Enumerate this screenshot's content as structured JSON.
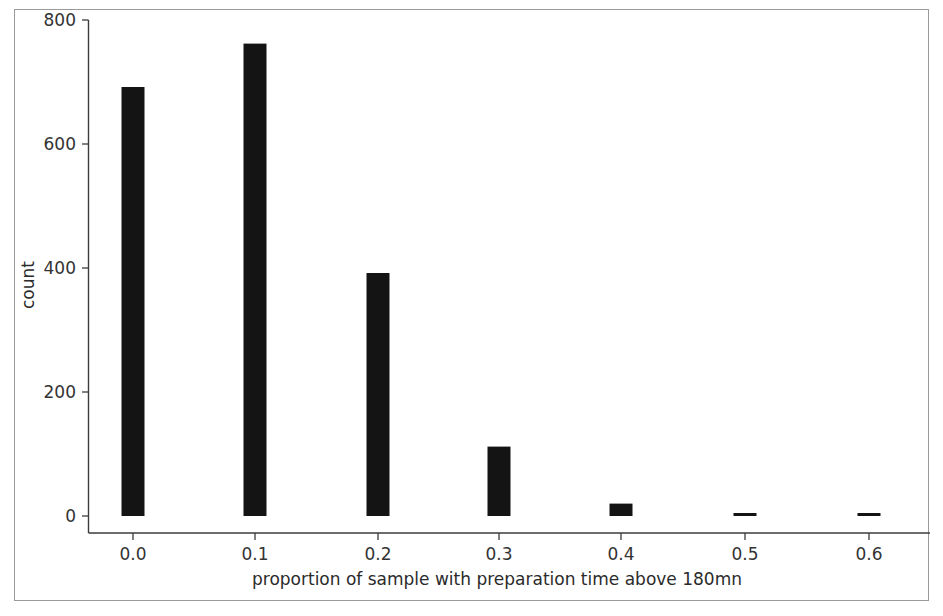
{
  "chart_data": {
    "type": "bar",
    "title": "",
    "subtitle": "",
    "xlabel": "proportion of sample with preparation time above 180mn",
    "ylabel": "count",
    "categories": [
      "0.0",
      "0.1",
      "0.2",
      "0.3",
      "0.4",
      "0.5",
      "0.6"
    ],
    "x": [
      0.0,
      0.1,
      0.2,
      0.3,
      0.4,
      0.5,
      0.6
    ],
    "values": [
      692,
      762,
      392,
      112,
      20,
      3,
      3
    ],
    "xlim": [
      -0.05,
      0.65
    ],
    "ylim": [
      0,
      820
    ],
    "xticks": [
      "0.0",
      "0.1",
      "0.2",
      "0.3",
      "0.4",
      "0.5",
      "0.6"
    ],
    "yticks": [
      "0",
      "200",
      "400",
      "600",
      "800"
    ],
    "ytick_values": [
      0,
      200,
      400,
      600,
      800
    ],
    "grid": false,
    "legend": false,
    "legend_position": "none",
    "bar_color": "#141414",
    "axis_color": "#3c3c3c",
    "background_color": "#ffffff"
  },
  "axes": {
    "y_label": "count",
    "x_label": "proportion of sample with preparation time above 180mn",
    "y_tick_labels": [
      "800",
      "600",
      "400",
      "200",
      "0"
    ],
    "x_tick_labels": [
      "0.0",
      "0.1",
      "0.2",
      "0.3",
      "0.4",
      "0.5",
      "0.6"
    ]
  }
}
